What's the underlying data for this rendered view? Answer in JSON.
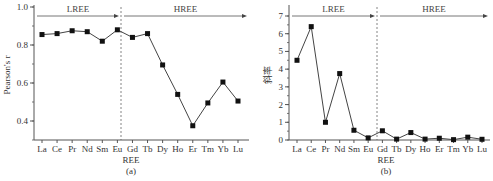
{
  "chart_data": [
    {
      "type": "line",
      "panel": "(a)",
      "title": "",
      "xlabel": "REE",
      "ylabel": "Pearson's r",
      "ylim": [
        0.3,
        1.0
      ],
      "yticks": [
        "0.4",
        "0.6",
        "0.8",
        "1.0"
      ],
      "categories": [
        "La",
        "Ce",
        "Pr",
        "Nd",
        "Sm",
        "Eu",
        "Gd",
        "Tb",
        "Dy",
        "Ho",
        "Er",
        "Tm",
        "Yb",
        "Lu"
      ],
      "values": [
        0.855,
        0.86,
        0.875,
        0.87,
        0.82,
        0.88,
        0.84,
        0.86,
        0.695,
        0.54,
        0.375,
        0.495,
        0.605,
        0.505
      ],
      "annotations": [
        {
          "text": "LREE",
          "type": "arrow-range",
          "from": "La",
          "to": "Eu"
        },
        {
          "text": "HREE",
          "type": "arrow-range",
          "from": "Gd",
          "to": "Lu"
        }
      ],
      "divider": "dashed vertical line between Eu and Gd",
      "grid": false,
      "legend": "none"
    },
    {
      "type": "line",
      "panel": "(b)",
      "title": "",
      "xlabel": "REE",
      "ylabel": "斜率",
      "ylim": [
        0,
        7.3
      ],
      "yticks": [
        "0",
        "1",
        "2",
        "3",
        "4",
        "5",
        "6",
        "7"
      ],
      "categories": [
        "La",
        "Ce",
        "Pr",
        "Nd",
        "Sm",
        "Eu",
        "Gd",
        "Tb",
        "Dy",
        "Ho",
        "Er",
        "Tm",
        "Yb",
        "Lu"
      ],
      "values": [
        4.5,
        6.4,
        1.0,
        3.75,
        0.55,
        0.12,
        0.52,
        0.05,
        0.42,
        0.05,
        0.1,
        0.02,
        0.16,
        0.04
      ],
      "annotations": [
        {
          "text": "LREE",
          "type": "arrow-range",
          "from": "La",
          "to": "Eu"
        },
        {
          "text": "HREE",
          "type": "arrow-range",
          "from": "Gd",
          "to": "Lu"
        }
      ],
      "divider": "dashed vertical line between Eu and Gd",
      "grid": false,
      "legend": "none"
    }
  ],
  "labels": {
    "panel_a": "(a)",
    "panel_b": "(b)",
    "xlabel": "REE",
    "ylabel_a": "Pearson's r",
    "ylabel_b": "斜率",
    "lree": "LREE",
    "hree": "HREE"
  }
}
